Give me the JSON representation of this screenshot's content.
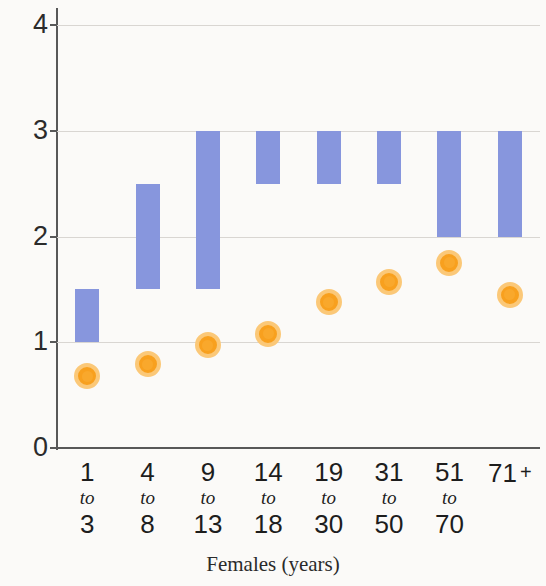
{
  "chart_data": {
    "type": "bar",
    "title": "",
    "subtitle": "",
    "xlabel": "Females (years)",
    "ylabel": "",
    "ylim": [
      0,
      4
    ],
    "yticks": [
      0,
      1,
      2,
      3,
      4
    ],
    "ytick_labels": [
      "0",
      "1",
      "2",
      "3",
      "4"
    ],
    "grid": true,
    "legend": "none",
    "categories": [
      "1 to 3",
      "4 to 8",
      "9 to 13",
      "14 to 18",
      "19 to 30",
      "31 to 50",
      "51 to 70",
      "71 +"
    ],
    "category_parts": [
      {
        "line1": "1",
        "line2": "to",
        "line3": "3"
      },
      {
        "line1": "4",
        "line2": "to",
        "line3": "8"
      },
      {
        "line1": "9",
        "line2": "to",
        "line3": "13"
      },
      {
        "line1": "14",
        "line2": "to",
        "line3": "18"
      },
      {
        "line1": "19",
        "line2": "to",
        "line3": "30"
      },
      {
        "line1": "31",
        "line2": "to",
        "line3": "50"
      },
      {
        "line1": "51",
        "line2": "to",
        "line3": "70"
      },
      {
        "line1": "71",
        "line2": "",
        "line3": "",
        "suffix": "+"
      }
    ],
    "series": [
      {
        "name": "range-bar",
        "type": "range-bar",
        "color": "#8796dd",
        "low": [
          1.0,
          1.5,
          1.5,
          2.5,
          2.5,
          2.5,
          2.0,
          2.0
        ],
        "high": [
          1.5,
          2.5,
          3.0,
          3.0,
          3.0,
          3.0,
          3.0,
          3.0
        ]
      },
      {
        "name": "marker",
        "type": "scatter",
        "color": "#f8a01e",
        "ring_color": "#fbc878",
        "values": [
          0.68,
          0.79,
          0.97,
          1.08,
          1.38,
          1.57,
          1.75,
          1.45
        ]
      }
    ]
  }
}
